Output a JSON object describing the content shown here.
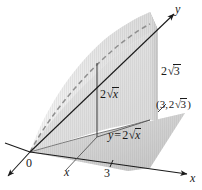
{
  "figure": {
    "kind": "3d-solid-diagram",
    "background_color": "#ffffff",
    "ink_color": "#1a1a1a"
  },
  "axes": {
    "y_label": "y",
    "x_label": "x",
    "origin_label": "0",
    "x_variable_label": "x",
    "x_tick_label": "3"
  },
  "labels": {
    "height_at_x3": "2√3",
    "corner_point": "(3, 2√3)",
    "height_general": "2√x",
    "curve_equation": "y = 2√x"
  },
  "math": {
    "two": "2",
    "radical_sign": "√",
    "radicand_three": "3",
    "radicand_x": "x",
    "y_var": "y",
    "equals": "=",
    "paren_open": "(",
    "paren_close": ")",
    "comma": ",",
    "three": "3"
  },
  "surfaces": [
    {
      "name": "base-plane-region",
      "fill": "#bdbdbd",
      "description": "Region in the xy-plane under the curve y = 2*sqrt(x) from x = 0 to x = 3"
    },
    {
      "name": "curved-cylinder-surface",
      "fill": "#dcdcdc",
      "description": "Parabolic cylinder surface y = 2*sqrt(x) rising vertically"
    },
    {
      "name": "vertical-end-plane",
      "fill": "#b0b0b0",
      "description": "Vertical plane face at x = 3 of height 2*sqrt(3)"
    },
    {
      "name": "interior-shading",
      "fill": "#c9c9c9",
      "description": "Shaded interior of the solid region"
    }
  ],
  "curves": [
    {
      "name": "dashed-top-curve",
      "style": "dashed",
      "color": "#9a9a9a",
      "description": "Dashed upper edge of the parabolic cylinder surface"
    },
    {
      "name": "base-curve",
      "style": "solid",
      "color": "#6e6e6e",
      "description": "Curve y = 2*sqrt(x) traced in the base plane"
    },
    {
      "name": "vertical-segment",
      "style": "solid",
      "color": "#555555",
      "description": "Vertical segment of height 2*sqrt(x) from base plane to surface"
    }
  ]
}
